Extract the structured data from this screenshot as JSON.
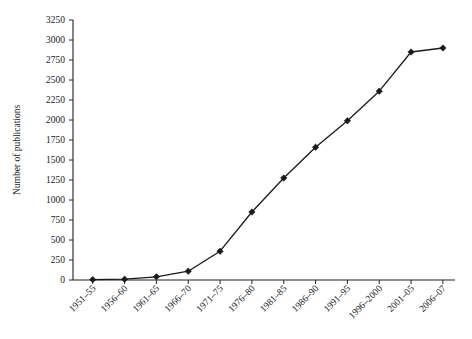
{
  "chart_data": {
    "type": "line",
    "title": "",
    "subtitle": "",
    "xlabel": "",
    "ylabel": "Number of publications",
    "categories": [
      "1951–55",
      "1956–60",
      "1961–65",
      "1966–70",
      "1971–75",
      "1976–80",
      "1981–85",
      "1986–90",
      "1991–95",
      "1996–2000",
      "2001–05",
      "2006–07"
    ],
    "values": [
      5,
      10,
      40,
      110,
      360,
      850,
      1275,
      1660,
      1990,
      2360,
      2850,
      2900
    ],
    "series": [
      {
        "name": "Number of publications",
        "values": [
          5,
          10,
          40,
          110,
          360,
          850,
          1275,
          1660,
          1990,
          2360,
          2850,
          2900
        ]
      }
    ],
    "ylim": [
      0,
      3250
    ],
    "yticks": [
      0,
      250,
      500,
      750,
      1000,
      1250,
      1500,
      1750,
      2000,
      2250,
      2500,
      2750,
      3000,
      3250
    ],
    "ytick_labels": [
      "0",
      "250",
      "500",
      "750",
      "1000",
      "1250",
      "1500",
      "1750",
      "2000",
      "2250",
      "2500",
      "2750",
      "3000",
      "3250"
    ],
    "grid": false,
    "legend": false,
    "legend_position": "none",
    "marker": "diamond",
    "line_color": "#1a1a1a",
    "marker_color": "#1a1a1a",
    "background_color": "#ffffff",
    "xtick_label_rotation": 45
  }
}
